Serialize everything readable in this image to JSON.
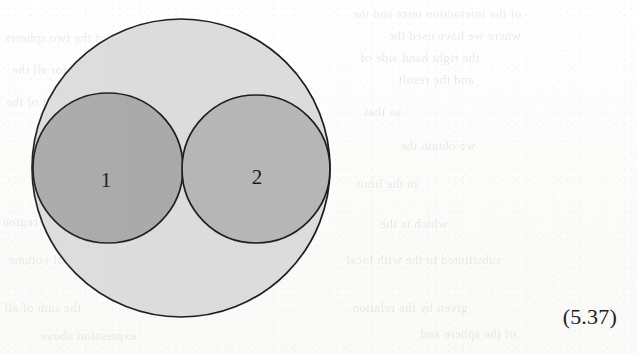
{
  "page": {
    "background_color": "#fdfdfc",
    "width": 637,
    "height": 354
  },
  "figure": {
    "name": "venn-style-tangent-circles-diagram",
    "outline_color": "#1e1e1e",
    "outer_circle": {
      "label": "",
      "fill": "#dcdcdc",
      "cx": 181,
      "cy": 168,
      "r": 149
    },
    "inner_circles": [
      {
        "label": "1",
        "fill": "#a9a9a9",
        "cx": 108,
        "cy": 168,
        "r": 75,
        "label_x": 106,
        "label_y": 175
      },
      {
        "label": "2",
        "fill": "#b6b6b6",
        "cx": 256,
        "cy": 169,
        "r": 74,
        "label_x": 257,
        "label_y": 172
      }
    ]
  },
  "equation": {
    "number": "(5.37)"
  },
  "bleed_through": {
    "note": "faint mirrored show-through text from the reverse side of the scanned page",
    "lines": [
      {
        "text": "of the interaction term and the",
        "x": 352,
        "y": 6,
        "size": 13
      },
      {
        "text": "where we have used the",
        "x": 388,
        "y": 28,
        "size": 13
      },
      {
        "text": "the right hand side of",
        "x": 360,
        "y": 50,
        "size": 13
      },
      {
        "text": "and the result",
        "x": 398,
        "y": 72,
        "size": 13
      },
      {
        "text": "so that",
        "x": 364,
        "y": 104,
        "size": 13
      },
      {
        "text": "we obtain the",
        "x": 400,
        "y": 138,
        "size": 13
      },
      {
        "text": "in the limit",
        "x": 356,
        "y": 176,
        "size": 13
      },
      {
        "text": "which is the",
        "x": 380,
        "y": 216,
        "size": 13
      },
      {
        "text": "substituted to the with local",
        "x": 346,
        "y": 252,
        "size": 13
      },
      {
        "text": "of the two spheres",
        "x": 4,
        "y": 30,
        "size": 13
      },
      {
        "text": "and for all the",
        "x": 12,
        "y": 62,
        "size": 13
      },
      {
        "text": "result of the",
        "x": 6,
        "y": 94,
        "size": 13
      },
      {
        "text": "in region",
        "x": 2,
        "y": 214,
        "size": 13
      },
      {
        "text": "total volume",
        "x": 8,
        "y": 252,
        "size": 13
      },
      {
        "text": "the sum of all",
        "x": 4,
        "y": 300,
        "size": 13
      },
      {
        "text": "given by the relation",
        "x": 352,
        "y": 300,
        "size": 13
      },
      {
        "text": "of the sphere and",
        "x": 420,
        "y": 326,
        "size": 13
      },
      {
        "text": "expression above",
        "x": 40,
        "y": 328,
        "size": 13
      }
    ]
  }
}
